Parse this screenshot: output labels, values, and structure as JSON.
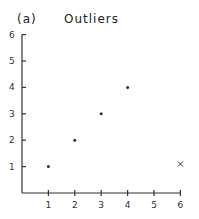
{
  "chart_data": {
    "type": "scatter",
    "panel_label": "(a)",
    "title": "Outliers",
    "xlabel": "",
    "ylabel": "",
    "xlim": [
      0,
      6
    ],
    "ylim": [
      0,
      6
    ],
    "x_ticks": [
      "1",
      "2",
      "3",
      "4",
      "5",
      "6"
    ],
    "y_ticks": [
      "1",
      "2",
      "3",
      "4",
      "5",
      "6"
    ],
    "grid": false,
    "legend": null,
    "series": [
      {
        "name": "points",
        "marker": "dot",
        "x": [
          1,
          2,
          3,
          4
        ],
        "y": [
          1,
          2,
          3,
          4
        ]
      },
      {
        "name": "outlier",
        "marker": "x",
        "x": [
          6
        ],
        "y": [
          1.1
        ]
      }
    ]
  },
  "colors": {
    "ink": "#333333",
    "background": "#ffffff"
  }
}
